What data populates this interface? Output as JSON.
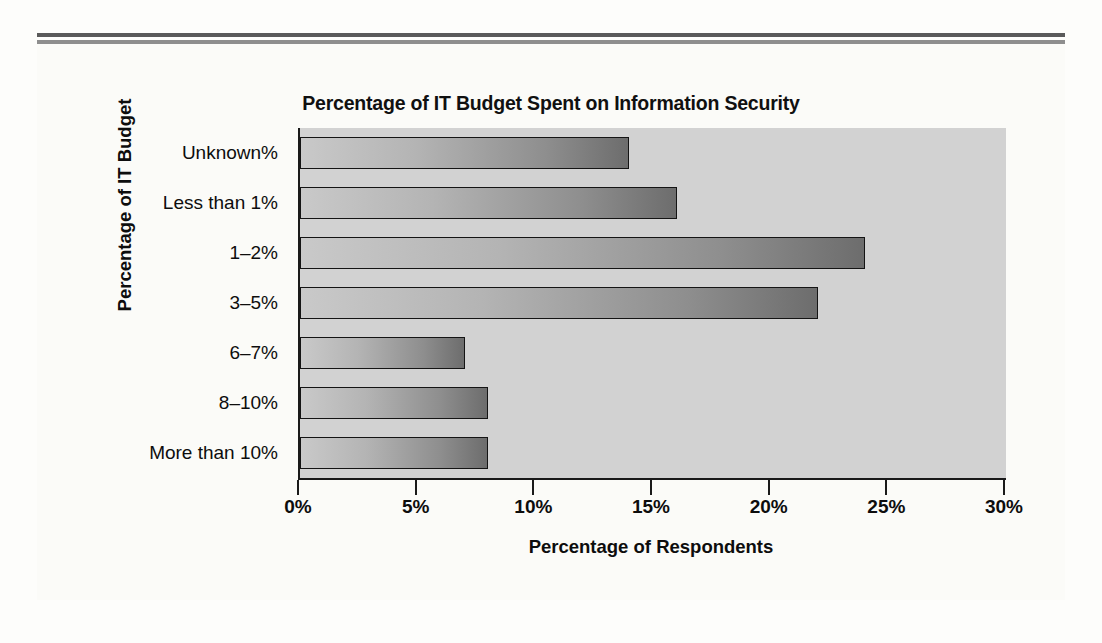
{
  "chart_data": {
    "type": "bar",
    "orientation": "horizontal",
    "title": "Percentage of IT Budget Spent on Information Security",
    "xlabel": "Percentage of Respondents",
    "ylabel": "Percentage of IT Budget",
    "categories": [
      "Unknown%",
      "Less than 1%",
      "1–2%",
      "3–5%",
      "6–7%",
      "8–10%",
      "More than 10%"
    ],
    "values": [
      14,
      16,
      24,
      22,
      7,
      8,
      8
    ],
    "xlim": [
      0,
      30
    ],
    "xticks": [
      0,
      5,
      10,
      15,
      20,
      25,
      30
    ],
    "xticklabels": [
      "0%",
      "5%",
      "10%",
      "15%",
      "20%",
      "25%",
      "30%"
    ],
    "grid": false,
    "legend": false,
    "colors": {
      "plot_background": "#d2d2d2",
      "page_background": "#fbfbf8",
      "bar_light": "#c9c9c9",
      "bar_dark": "#6d6d6d",
      "bar_border": "#141414",
      "axis": "#1a1a1a",
      "text": "#0d0d0d",
      "rule_dark": "#5a5a5a",
      "rule_light": "#8e8e8e"
    }
  }
}
